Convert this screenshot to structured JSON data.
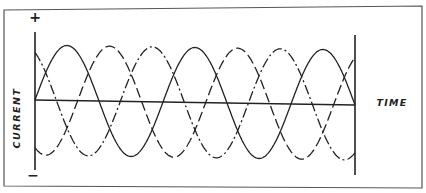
{
  "diagram": {
    "title": "",
    "labels": {
      "y_axis": "CURRENT",
      "x_axis": "TIME",
      "positive": "+",
      "negative": "−"
    },
    "colors": {
      "line": "#222222",
      "frame": "#555555",
      "background": "#ffffff"
    }
  },
  "chart_data": {
    "type": "line",
    "title": "",
    "xlabel": "TIME",
    "ylabel": "CURRENT",
    "amplitude": 1,
    "phase_offsets_deg": [
      0,
      120,
      240
    ],
    "cycles_shown": 2.5,
    "series": [
      {
        "name": "phase-1",
        "style": "solid",
        "phase_deg": 0
      },
      {
        "name": "phase-2",
        "style": "dashed",
        "phase_deg": 120
      },
      {
        "name": "phase-3",
        "style": "dash-dot",
        "phase_deg": 240
      }
    ],
    "ylim": [
      -1,
      1
    ],
    "grid": false,
    "legend": "none"
  }
}
